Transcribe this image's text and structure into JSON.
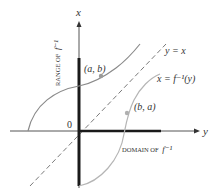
{
  "diagram": {
    "axes": {
      "vertical_label": "x",
      "horizontal_label": "y",
      "origin_label": "0"
    },
    "labels": {
      "line_identity": "y = x",
      "inverse_curve": "x = f⁻¹(y)",
      "point_ab": "(a, b)",
      "point_ba": "(b, a)",
      "domain": "DOMAIN OF",
      "domain_func": "f⁻¹",
      "range": "RANGE OF",
      "range_func": "f⁻¹"
    },
    "colors": {
      "axis": "#3a3a3a",
      "axis_thick": "#1a1a1a",
      "curve_f": "#8a8a8a",
      "curve_inverse": "#b5b5b5",
      "dashed_line": "#7a7a7a",
      "point": "#9a9a9a",
      "text": "#333333"
    }
  }
}
